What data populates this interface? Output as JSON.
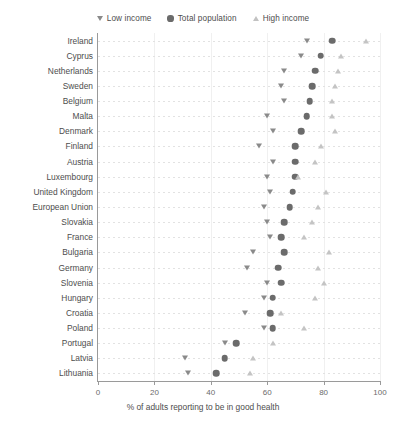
{
  "chart_data": {
    "type": "scatter",
    "title": "",
    "xlabel": "% of adults reporting to be in good health",
    "ylabel": "",
    "xlim": [
      0,
      100
    ],
    "xticks": [
      0,
      20,
      40,
      60,
      80,
      100
    ],
    "grid": true,
    "legend_position": "top-center",
    "orientation": "horizontal",
    "categories": [
      "Ireland",
      "Cyprus",
      "Netherlands",
      "Sweden",
      "Belgium",
      "Malta",
      "Denmark",
      "Finland",
      "Austria",
      "Luxembourg",
      "United Kingdom",
      "European Union",
      "Slovakia",
      "France",
      "Bulgaria",
      "Germany",
      "Slovenia",
      "Hungary",
      "Croatia",
      "Poland",
      "Portugal",
      "Latvia",
      "Lithuania"
    ],
    "series": [
      {
        "name": "Low income",
        "marker": "triangle-down",
        "color": "#8a8a8a",
        "values": [
          74,
          72,
          66,
          65,
          66,
          60,
          62,
          57,
          62,
          60,
          61,
          59,
          60,
          61,
          55,
          53,
          60,
          59,
          52,
          59,
          45,
          31,
          32
        ]
      },
      {
        "name": "Total population",
        "marker": "circle",
        "color": "#6b6b6b",
        "values": [
          83,
          79,
          77,
          76,
          75,
          74,
          72,
          70,
          70,
          70,
          69,
          68,
          66,
          65,
          66,
          64,
          65,
          62,
          61,
          62,
          49,
          45,
          42
        ]
      },
      {
        "name": "High income",
        "marker": "triangle-up",
        "color": "#c4c4c4",
        "values": [
          95,
          86,
          85,
          84,
          83,
          83,
          84,
          79,
          77,
          71,
          81,
          78,
          76,
          73,
          82,
          78,
          80,
          77,
          65,
          73,
          62,
          55,
          54
        ]
      }
    ]
  },
  "legend": {
    "items": [
      {
        "label": "Low income",
        "marker": "triangle-down-icon"
      },
      {
        "label": "Total population",
        "marker": "circle-icon"
      },
      {
        "label": "High income",
        "marker": "triangle-up-icon"
      }
    ]
  },
  "axis": {
    "x_title": "% of adults reporting to be in good health",
    "x_tick_labels": [
      "0",
      "20",
      "40",
      "60",
      "80",
      "100"
    ]
  }
}
